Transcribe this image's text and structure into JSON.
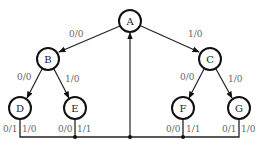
{
  "diagram": {
    "type": "state-tree-with-feedback",
    "nodes": [
      {
        "id": "A",
        "label": "A",
        "x": 130,
        "y": 21
      },
      {
        "id": "B",
        "label": "B",
        "x": 48,
        "y": 59
      },
      {
        "id": "C",
        "label": "C",
        "x": 210,
        "y": 59
      },
      {
        "id": "D",
        "label": "D",
        "x": 20,
        "y": 108
      },
      {
        "id": "E",
        "label": "E",
        "x": 75,
        "y": 108
      },
      {
        "id": "F",
        "label": "F",
        "x": 183,
        "y": 108
      },
      {
        "id": "G",
        "label": "G",
        "x": 239,
        "y": 108
      }
    ],
    "edges": [
      {
        "from": "A",
        "to": "B",
        "label": "0/0"
      },
      {
        "from": "A",
        "to": "C",
        "label": "1/0"
      },
      {
        "from": "B",
        "to": "D",
        "label": "0/0"
      },
      {
        "from": "B",
        "to": "E",
        "label": "1/0"
      },
      {
        "from": "C",
        "to": "F",
        "label": "0/0"
      },
      {
        "from": "C",
        "to": "G",
        "label": "1/0"
      }
    ],
    "return_labels": {
      "D": [
        "0/1",
        "1/0"
      ],
      "E": [
        "0/0",
        "1/1"
      ],
      "F": [
        "0/0",
        "1/1"
      ],
      "G": [
        "0/1",
        "1/0"
      ]
    },
    "feedback": {
      "target": "A",
      "description": "all leaf transitions return to A via common bus"
    }
  },
  "labels": {
    "A": "A",
    "B": "B",
    "C": "C",
    "D": "D",
    "E": "E",
    "F": "F",
    "G": "G",
    "AB": "0/0",
    "AC": "1/0",
    "BD": "0/0",
    "BE": "1/0",
    "CF": "0/0",
    "CG": "1/0",
    "D_left": "0/1",
    "D_right": "1/0",
    "E_left": "0/0",
    "E_right": "1/1",
    "F_left": "0/0",
    "F_right": "1/1",
    "G_left": "0/1",
    "G_right": "1/0"
  }
}
